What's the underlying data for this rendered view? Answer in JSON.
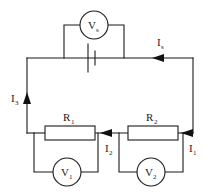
{
  "diagram": {
    "colors": {
      "wire": "#1a1a1a",
      "background": "#ffffff",
      "arrow": "#111111"
    },
    "meters": [
      {
        "id": "vs",
        "base": "V",
        "sub": "s",
        "kind": "voltmeter-circle"
      },
      {
        "id": "v1",
        "base": "V",
        "sub": "1",
        "kind": "voltmeter-circle"
      },
      {
        "id": "v2",
        "base": "V",
        "sub": "2",
        "kind": "voltmeter-circle"
      }
    ],
    "resistors": [
      {
        "id": "r1",
        "base": "R",
        "sub": "1",
        "kind": "resistor-box"
      },
      {
        "id": "r2",
        "base": "R",
        "sub": "2",
        "kind": "resistor-box"
      }
    ],
    "source": {
      "id": "battery",
      "kind": "battery-symbol"
    },
    "currents": [
      {
        "id": "is",
        "base": "I",
        "sub": "s",
        "direction": "right"
      },
      {
        "id": "i3",
        "base": "I",
        "sub": "3",
        "direction": "up"
      },
      {
        "id": "i2",
        "base": "I",
        "sub": "2",
        "direction": "left"
      },
      {
        "id": "i1",
        "base": "I",
        "sub": "1",
        "direction": "left"
      }
    ]
  }
}
